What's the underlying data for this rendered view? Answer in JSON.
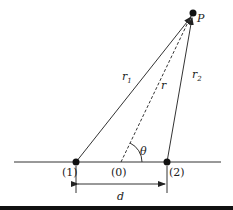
{
  "diagram": {
    "point_p": "P",
    "r1": "r",
    "r1_sub": "1",
    "r2": "r",
    "r2_sub": "2",
    "r": "r",
    "theta": "θ",
    "point_1": "(1)",
    "point_0": "(0)",
    "point_2": "(2)",
    "distance": "d"
  },
  "colors": {
    "stroke": "#222222",
    "bar": "#111111"
  }
}
